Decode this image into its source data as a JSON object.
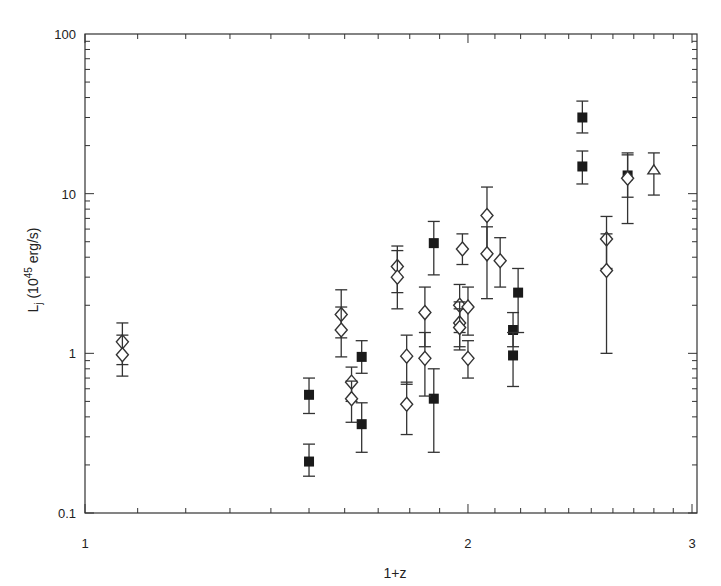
{
  "chart_data": {
    "type": "scatter",
    "title": "",
    "xlabel": "1+z",
    "ylabel": "L_j (10^45 erg/s)",
    "xscale": "log",
    "yscale": "log",
    "xlim": [
      1,
      3
    ],
    "ylim": [
      0.1,
      100
    ],
    "x_ticks": [
      "1",
      "2",
      "3"
    ],
    "y_ticks": [
      "0.1",
      "1",
      "10",
      "100"
    ],
    "grid": false,
    "legend": null,
    "series": [
      {
        "name": "filled squares",
        "marker": "filled-square",
        "points": [
          {
            "x": 1.5,
            "y": 0.55,
            "ylo": 0.42,
            "yhi": 0.7
          },
          {
            "x": 1.5,
            "y": 0.21,
            "ylo": 0.17,
            "yhi": 0.27
          },
          {
            "x": 1.65,
            "y": 0.95,
            "ylo": 0.75,
            "yhi": 1.2
          },
          {
            "x": 1.65,
            "y": 0.36,
            "ylo": 0.24,
            "yhi": 0.49
          },
          {
            "x": 1.88,
            "y": 4.9,
            "ylo": 3.1,
            "yhi": 6.7
          },
          {
            "x": 1.88,
            "y": 0.52,
            "ylo": 0.24,
            "yhi": 0.8
          },
          {
            "x": 2.17,
            "y": 1.4,
            "ylo": 1.1,
            "yhi": 1.8
          },
          {
            "x": 2.17,
            "y": 0.97,
            "ylo": 0.62,
            "yhi": 1.35
          },
          {
            "x": 2.19,
            "y": 2.4,
            "ylo": 1.35,
            "yhi": 3.4
          },
          {
            "x": 2.46,
            "y": 30,
            "ylo": 24,
            "yhi": 38
          },
          {
            "x": 2.46,
            "y": 14.8,
            "ylo": 11.5,
            "yhi": 18.5
          },
          {
            "x": 2.67,
            "y": 13,
            "ylo": 9.5,
            "yhi": 17.5
          }
        ]
      },
      {
        "name": "open diamonds",
        "marker": "open-diamond",
        "points": [
          {
            "x": 1.07,
            "y": 1.18,
            "ylo": 0.85,
            "yhi": 1.55
          },
          {
            "x": 1.07,
            "y": 0.98,
            "ylo": 0.72,
            "yhi": 1.3
          },
          {
            "x": 1.59,
            "y": 1.75,
            "ylo": 1.25,
            "yhi": 2.5
          },
          {
            "x": 1.59,
            "y": 1.4,
            "ylo": 0.95,
            "yhi": 1.95
          },
          {
            "x": 1.62,
            "y": 0.66,
            "ylo": 0.5,
            "yhi": 0.82
          },
          {
            "x": 1.62,
            "y": 0.52,
            "ylo": 0.37,
            "yhi": 0.67
          },
          {
            "x": 1.76,
            "y": 3.5,
            "ylo": 2.4,
            "yhi": 4.7
          },
          {
            "x": 1.76,
            "y": 3.0,
            "ylo": 1.9,
            "yhi": 4.4
          },
          {
            "x": 1.79,
            "y": 0.96,
            "ylo": 0.64,
            "yhi": 1.3
          },
          {
            "x": 1.79,
            "y": 0.48,
            "ylo": 0.31,
            "yhi": 0.66
          },
          {
            "x": 1.85,
            "y": 1.8,
            "ylo": 1.1,
            "yhi": 2.6
          },
          {
            "x": 1.85,
            "y": 0.93,
            "ylo": 0.54,
            "yhi": 1.35
          },
          {
            "x": 1.98,
            "y": 4.5,
            "ylo": 3.6,
            "yhi": 5.6
          },
          {
            "x": 1.97,
            "y": 2.0,
            "ylo": 1.35,
            "yhi": 2.7
          },
          {
            "x": 1.97,
            "y": 1.55,
            "ylo": 1.1,
            "yhi": 2.1
          },
          {
            "x": 1.97,
            "y": 1.45,
            "ylo": 1.05,
            "yhi": 1.9
          },
          {
            "x": 2.0,
            "y": 1.95,
            "ylo": 1.3,
            "yhi": 2.6
          },
          {
            "x": 2.0,
            "y": 0.93,
            "ylo": 0.7,
            "yhi": 1.2
          },
          {
            "x": 2.07,
            "y": 7.3,
            "ylo": 4.2,
            "yhi": 11
          },
          {
            "x": 2.07,
            "y": 4.2,
            "ylo": 2.2,
            "yhi": 6.2
          },
          {
            "x": 2.12,
            "y": 3.8,
            "ylo": 2.6,
            "yhi": 5.3
          },
          {
            "x": 2.57,
            "y": 5.2,
            "ylo": 3.4,
            "yhi": 7.2
          },
          {
            "x": 2.57,
            "y": 3.3,
            "ylo": 1.0,
            "yhi": 5.6
          },
          {
            "x": 2.67,
            "y": 12.5,
            "ylo": 6.5,
            "yhi": 18
          }
        ]
      },
      {
        "name": "open up-arrow",
        "marker": "open-arrow-up",
        "points": [
          {
            "x": 2.8,
            "y": 13.5,
            "ylo": 9.8,
            "yhi": 18
          }
        ]
      }
    ]
  }
}
